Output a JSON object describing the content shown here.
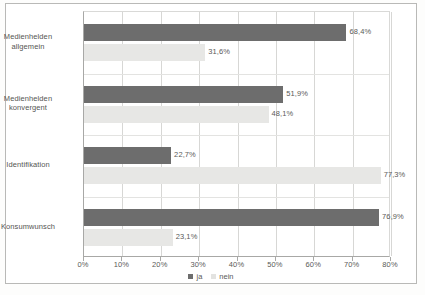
{
  "chart_data": {
    "type": "bar",
    "orientation": "horizontal",
    "title": "",
    "xlabel": "",
    "ylabel": "",
    "xlim": [
      0,
      80
    ],
    "grid": true,
    "legend_position": "bottom-center",
    "categories": [
      "Medienhelden allgemein",
      "Medienhelden konvergent",
      "Identifikation",
      "Konsumwunsch"
    ],
    "category_lines": [
      [
        "Medienhelden",
        "allgemein"
      ],
      [
        "Medienhelden",
        "konvergent"
      ],
      [
        "Identifikation"
      ],
      [
        "Konsumwunsch"
      ]
    ],
    "series": [
      {
        "name": "ja",
        "color": "#6d6d6d",
        "values": [
          68.4,
          51.9,
          22.7,
          76.9
        ],
        "labels": [
          "68,4%",
          "51,9%",
          "22,7%",
          "76,9%"
        ]
      },
      {
        "name": "nein",
        "color": "#e7e7e5",
        "values": [
          31.6,
          48.1,
          77.3,
          23.1
        ],
        "labels": [
          "31,6%",
          "48,1%",
          "77,3%",
          "23,1%"
        ]
      }
    ],
    "xticks": [
      0,
      10,
      20,
      30,
      40,
      50,
      60,
      70,
      80
    ],
    "xtick_labels": [
      "0%",
      "10%",
      "20%",
      "30%",
      "40%",
      "50%",
      "60%",
      "70%",
      "80%"
    ]
  },
  "legend": {
    "items": [
      {
        "label": "ja"
      },
      {
        "label": "nein"
      }
    ]
  }
}
